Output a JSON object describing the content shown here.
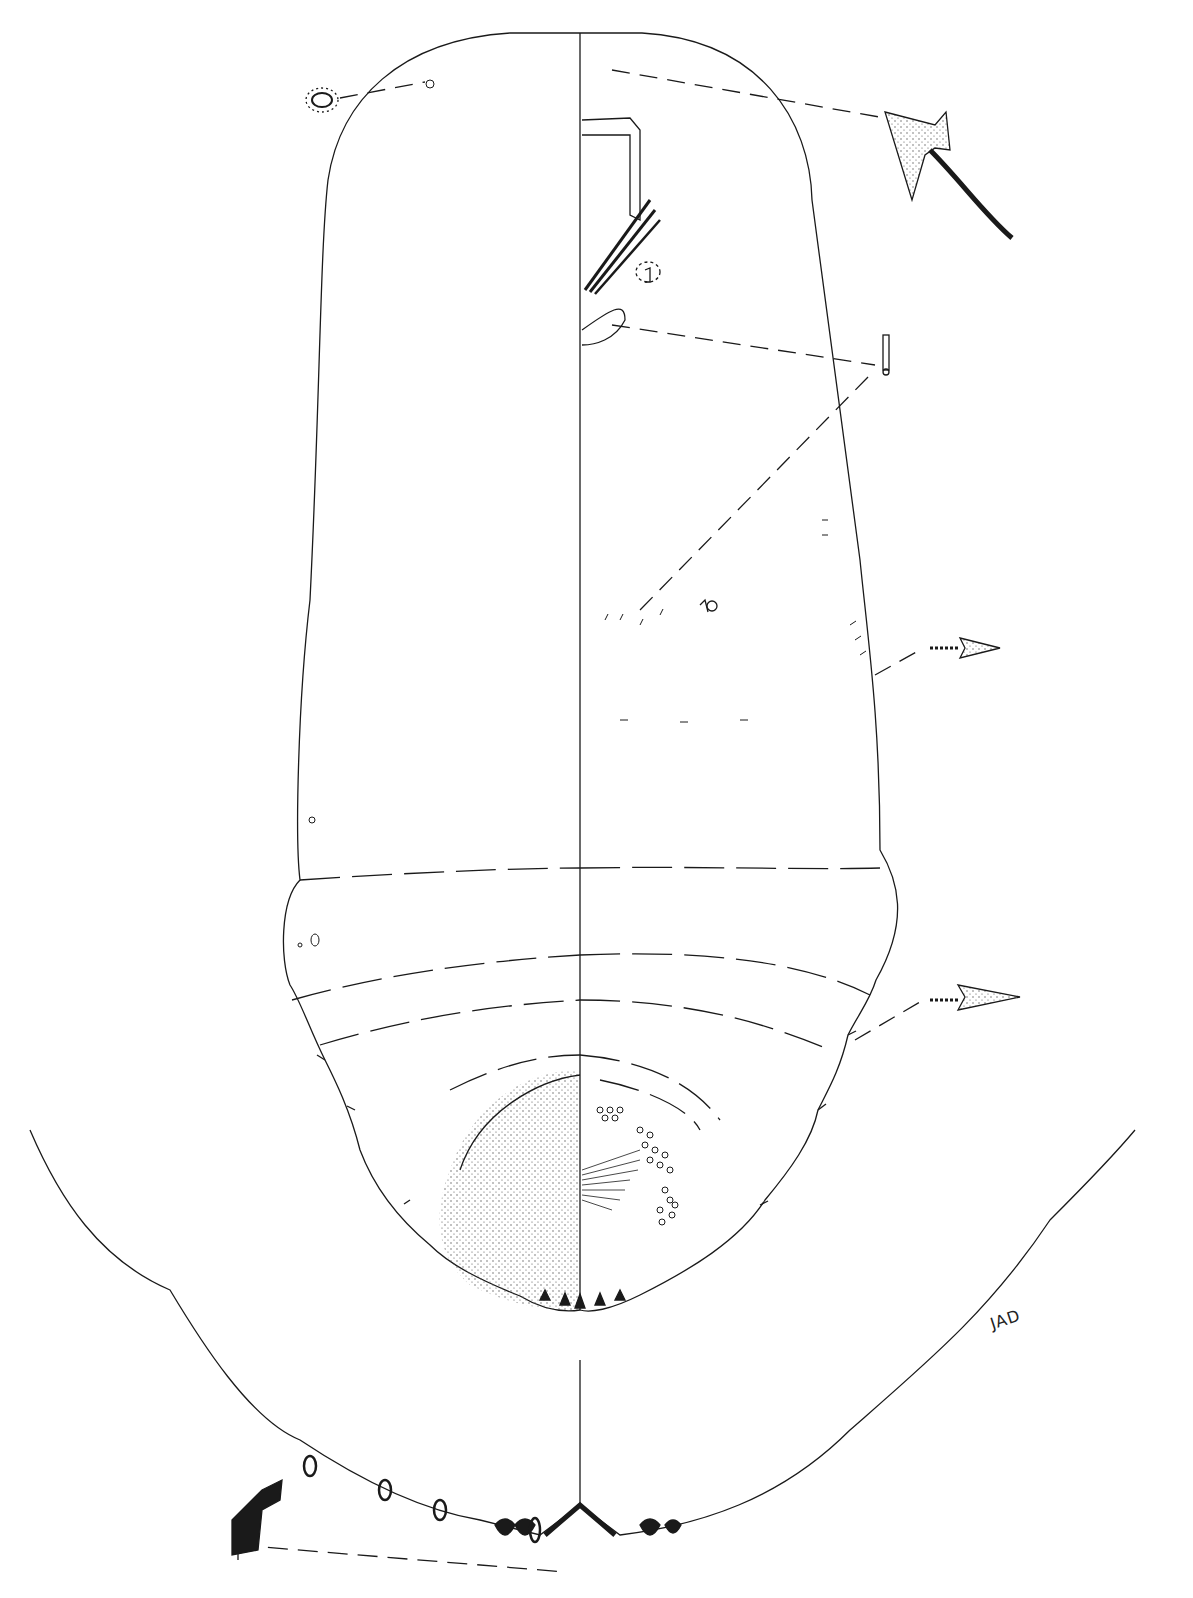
{
  "figure": {
    "type": "biological line illustration",
    "signature": "JAD",
    "colors": {
      "line": "#1a1a1a",
      "background": "#ffffff",
      "stipple": "#444444"
    }
  },
  "insets": [
    {
      "name": "dorsal-pore-inset",
      "description": "enlarged microduct / pore"
    },
    {
      "name": "spine-inset",
      "description": "enlarged marginal spine with setal base"
    },
    {
      "name": "ventral-duct-inset",
      "description": "clustered ventral ducts and setae"
    },
    {
      "name": "marginal-spine-inset-upper",
      "description": "enlarged marginal conical spine"
    },
    {
      "name": "marginal-spine-inset-lower",
      "description": "enlarged marginal conical spine"
    },
    {
      "name": "pygidium-margin-enlargement",
      "description": "enlarged posterior margin with lobes and plates"
    },
    {
      "name": "plate-detail-inset",
      "description": "enlarged gland spine/plate"
    }
  ]
}
